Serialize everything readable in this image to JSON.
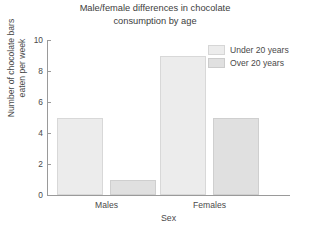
{
  "chart_data": {
    "type": "bar",
    "title": "Male/female differences in chocolate\nconsumption by age",
    "xlabel": "Sex",
    "ylabel": "Number of chocolate bars\neaten per week",
    "categories": [
      "Males",
      "Females"
    ],
    "series": [
      {
        "name": "Under 20 years",
        "values": [
          5,
          9
        ],
        "color": "#ececec"
      },
      {
        "name": "Over 20 years",
        "values": [
          1,
          5
        ],
        "color": "#e0e0e0"
      }
    ],
    "ylim": [
      0,
      10
    ],
    "yticks": [
      0,
      2,
      4,
      6,
      8,
      10
    ],
    "ytick_labels": [
      "0",
      "2",
      "4",
      "6",
      "8",
      "10"
    ],
    "grid": false,
    "legend_position": "top-right",
    "axis_color": "#9a9a9a"
  },
  "legend": {
    "items": [
      {
        "label": "Under 20 years"
      },
      {
        "label": "Over 20 years"
      }
    ]
  }
}
